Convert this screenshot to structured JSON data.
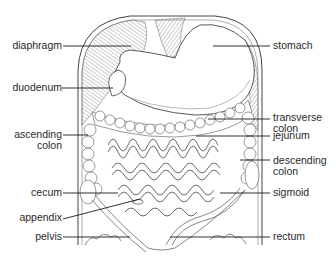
{
  "diagram": {
    "type": "anatomical-illustration",
    "labels_left": [
      {
        "id": "diaphragm",
        "text": "diaphragm"
      },
      {
        "id": "duodenum",
        "text": "duodenum"
      },
      {
        "id": "ascending-colon",
        "line1": "ascending",
        "line2": "colon"
      },
      {
        "id": "cecum",
        "text": "cecum"
      },
      {
        "id": "appendix",
        "text": "appendix"
      },
      {
        "id": "pelvis",
        "text": "pelvis"
      }
    ],
    "labels_right": [
      {
        "id": "stomach",
        "text": "stomach"
      },
      {
        "id": "transverse-colon",
        "line1": "transverse",
        "line2": "colon"
      },
      {
        "id": "jejunum",
        "text": "jejunum"
      },
      {
        "id": "descending-colon",
        "line1": "descending",
        "line2": "colon"
      },
      {
        "id": "sigmoid",
        "text": "sigmoid"
      },
      {
        "id": "rectum",
        "text": "rectum"
      }
    ],
    "colors": {
      "ink": "#2a2a2a",
      "leader": "#1a1a1a",
      "background": "#ffffff"
    }
  }
}
